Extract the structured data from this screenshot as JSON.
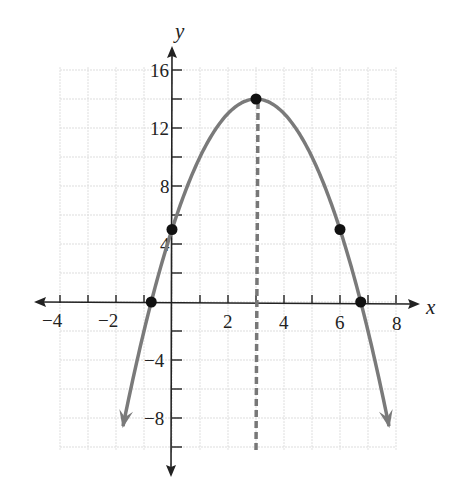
{
  "chart_data": {
    "type": "line",
    "title": "",
    "function": "y = -x^2 + 6x + 5",
    "xlabel": "x",
    "ylabel": "y",
    "xlim": [
      -4,
      8
    ],
    "ylim": [
      -10,
      17
    ],
    "grid": true,
    "x_ticks": [
      "-4",
      "-2",
      "2",
      "4",
      "6",
      "8"
    ],
    "y_ticks": [
      "16",
      "12",
      "8",
      "4",
      "-4",
      "-8"
    ],
    "points": [
      {
        "label": "y-intercept",
        "x": 0,
        "y": 5
      },
      {
        "label": "vertex",
        "x": 3,
        "y": 14
      },
      {
        "label": "symmetric point",
        "x": 6,
        "y": 5
      },
      {
        "label": "x-intercept left",
        "x": -0.74,
        "y": 0
      },
      {
        "label": "x-intercept right",
        "x": 6.74,
        "y": 0
      }
    ],
    "axis_of_symmetry": {
      "x": 3,
      "style": "dashed"
    },
    "series": [
      {
        "name": "parabola",
        "x": [
          -1.9,
          -1,
          0,
          1,
          2,
          3,
          4,
          5,
          6,
          7,
          7.9
        ],
        "values": [
          -10.01,
          -2,
          5,
          10,
          13,
          14,
          13,
          10,
          5,
          -2,
          -10.01
        ]
      }
    ],
    "colors": {
      "curve": "#777777",
      "axis": "#222222",
      "grid": "#dddddd",
      "points": "#111111"
    }
  },
  "labels": {
    "x_axis": "x",
    "y_axis": "y",
    "x_ticks": [
      "−4",
      "−2",
      "2",
      "4",
      "6",
      "8"
    ],
    "y_ticks": [
      "16",
      "12",
      "8",
      "4",
      "−4",
      "−8"
    ]
  }
}
